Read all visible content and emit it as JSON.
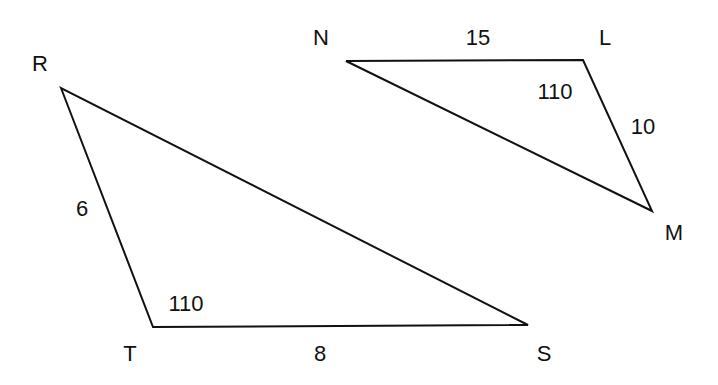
{
  "diagram": {
    "stroke_color": "#111111",
    "background": "#ffffff",
    "triangles": [
      {
        "name": "RTS",
        "vertices": [
          {
            "label": "R",
            "x": 61,
            "y": 88,
            "label_x": 40,
            "label_y": 64
          },
          {
            "label": "T",
            "x": 153,
            "y": 327,
            "label_x": 130,
            "label_y": 354
          },
          {
            "label": "S",
            "x": 528,
            "y": 325,
            "label_x": 544,
            "label_y": 354
          }
        ],
        "sides": [
          {
            "between": "RT",
            "length": "6",
            "label_x": 82,
            "label_y": 209
          },
          {
            "between": "TS",
            "length": "8",
            "label_x": 320,
            "label_y": 354
          }
        ],
        "angles": [
          {
            "at": "T",
            "value": "110",
            "label_x": 186,
            "label_y": 304
          }
        ]
      },
      {
        "name": "NLM",
        "vertices": [
          {
            "label": "N",
            "x": 346,
            "y": 61,
            "label_x": 321,
            "label_y": 38
          },
          {
            "label": "L",
            "x": 583,
            "y": 60,
            "label_x": 605,
            "label_y": 38
          },
          {
            "label": "M",
            "x": 652,
            "y": 211,
            "label_x": 674,
            "label_y": 233
          }
        ],
        "sides": [
          {
            "between": "NL",
            "length": "15",
            "label_x": 478,
            "label_y": 38
          },
          {
            "between": "LM",
            "length": "10",
            "label_x": 643,
            "label_y": 127
          }
        ],
        "angles": [
          {
            "at": "L",
            "value": "110",
            "label_x": 555,
            "label_y": 92
          }
        ]
      }
    ]
  }
}
